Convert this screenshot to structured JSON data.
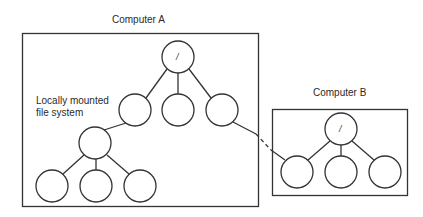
{
  "diagram": {
    "computer_a": {
      "title": "Computer A",
      "annotation_line1": "Locally mounted",
      "annotation_line2": "file system",
      "root_label": "/"
    },
    "computer_b": {
      "title": "Computer B",
      "root_label": "/"
    },
    "colors": {
      "stroke": "#333333",
      "background": "#ffffff"
    }
  }
}
